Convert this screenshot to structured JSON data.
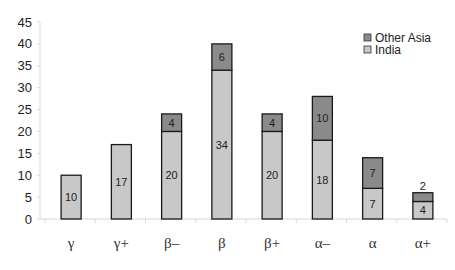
{
  "chart_data": {
    "type": "bar",
    "stacked": true,
    "title": "",
    "xlabel": "",
    "ylabel": "",
    "ylim": [
      0,
      45
    ],
    "yticks": [
      0,
      5,
      10,
      15,
      20,
      25,
      30,
      35,
      40,
      45
    ],
    "grid": false,
    "legend_position": "top-right",
    "categories": [
      "γ",
      "γ+",
      "β–",
      "β",
      "β+",
      "α–",
      "α",
      "α+"
    ],
    "series": [
      {
        "name": "India",
        "color": "#c8c8c8",
        "values": [
          10,
          17,
          20,
          34,
          20,
          18,
          7,
          4
        ]
      },
      {
        "name": "Other Asia",
        "color": "#8a8a8a",
        "values": [
          0,
          0,
          4,
          6,
          4,
          10,
          7,
          2
        ]
      }
    ],
    "legend": [
      "Other Asia",
      "India"
    ]
  }
}
